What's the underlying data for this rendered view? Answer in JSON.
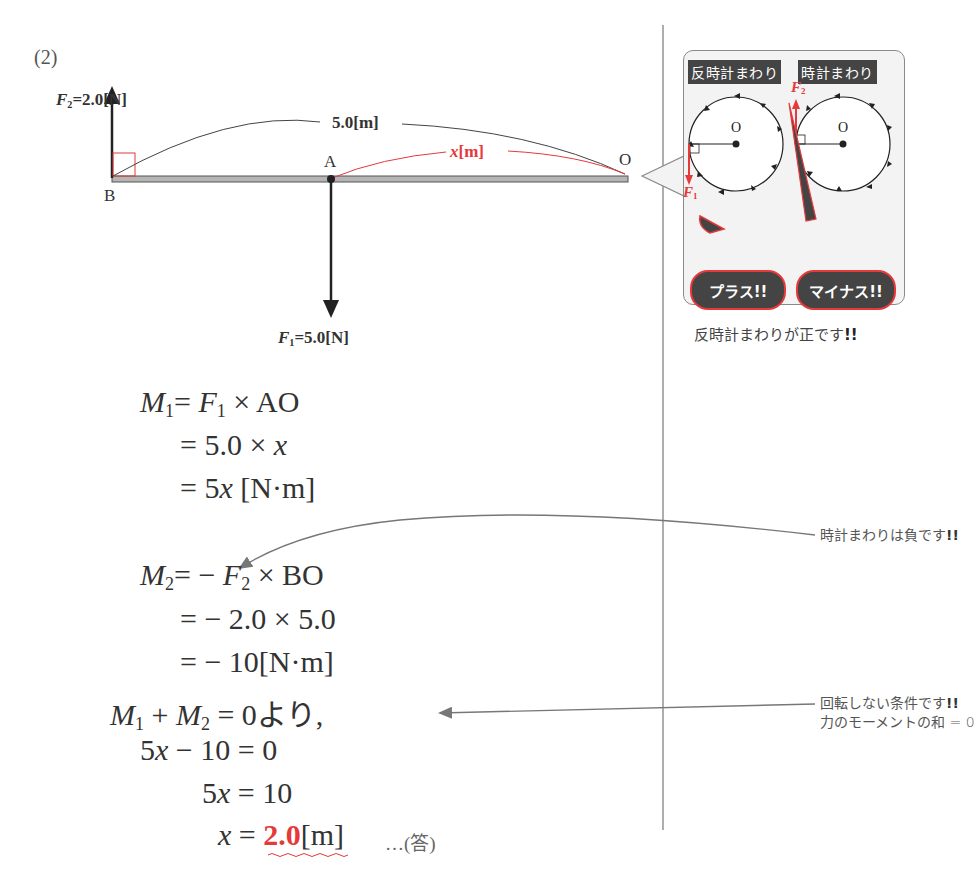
{
  "problem_number": "(2)",
  "diagram": {
    "f2_label": {
      "symbol": "F",
      "sub": "2",
      "value": "=2.0[N]"
    },
    "f1_label": {
      "symbol": "F",
      "sub": "1",
      "value": "=5.0[N]"
    },
    "span_label": "5.0[m]",
    "x_label_var": "x",
    "x_label_unit": "[m]",
    "point_a": "A",
    "point_b": "B",
    "point_o": "O",
    "colors": {
      "accent": "#e5393b",
      "beam": "#9a9a9a",
      "ink": "#333333"
    }
  },
  "inset": {
    "tag_ccw": "反時計まわり",
    "tag_cw": "時計まわり",
    "center_left": "O",
    "center_right": "O",
    "f1": {
      "symbol": "F",
      "sub": "1"
    },
    "f2": {
      "symbol": "F",
      "sub": "2"
    },
    "bubble_plus": "プラス!!",
    "bubble_minus": "マイナス!!",
    "caption": "反時計まわりが正です",
    "caption_bang": "!!"
  },
  "equations": {
    "m1": {
      "lhs_sym": "M",
      "lhs_sub": "1",
      "rhs_a": "= ",
      "f_sym": "F",
      "f_sub": "1",
      "rhs_b": " × AO"
    },
    "m1_line2_pre": "= 5.0 × ",
    "m1_line2_var": "x",
    "m1_line3_pre": "= 5",
    "m1_line3_var": "x",
    "m1_line3_unit": " [N·m]",
    "m2": {
      "lhs_sym": "M",
      "lhs_sub": "2",
      "rhs_a": "= − ",
      "f_sym": "F",
      "f_sub": "2",
      "rhs_b": " × BO"
    },
    "m2_line2": "= − 2.0 × 5.0",
    "m2_line3": "= − 10[N·m]",
    "sum": {
      "m1_sym": "M",
      "m1_sub": "1",
      "plus": " + ",
      "m2_sym": "M",
      "m2_sub": "2",
      "rest": " = 0より,"
    },
    "step1_pre": "5",
    "step1_var": "x",
    "step1_rest": " − 10 = 0",
    "step2_pre": "5",
    "step2_var": "x",
    "step2_rest": " = 10",
    "answer_var": "x",
    "answer_eq": " = ",
    "answer_value": "2.0",
    "answer_unit": "[m]",
    "answer_mark": "…(答)"
  },
  "side_notes": {
    "note1": "時計まわりは負です",
    "note1_bang": "!!",
    "note2_line1": "回転しない条件です",
    "note2_bang": "!!",
    "note2_line2": "力のモーメントの和 = 0"
  }
}
